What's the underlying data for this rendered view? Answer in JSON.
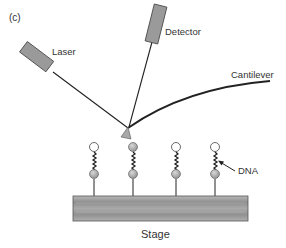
{
  "figure": {
    "panel_label": "(c)"
  },
  "labels": {
    "laser": "Laser",
    "detector": "Detector",
    "cantilever": "Cantilever",
    "dna": "DNA",
    "stage": "Stage"
  },
  "components": {
    "laser": {
      "shape": "rectangle",
      "fill": "#9a9a9a",
      "stroke": "#444444"
    },
    "detector": {
      "shape": "rectangle",
      "fill": "#9a9a9a",
      "stroke": "#444444"
    },
    "cantilever": {
      "shape": "curve",
      "stroke": "#222222"
    },
    "tip": {
      "shape": "triangle",
      "fill": "#a8a8a8"
    },
    "stage": {
      "shape": "rectangle",
      "fill": "#9e9e9e"
    }
  },
  "molecules": [
    {
      "index": 1,
      "top_sphere": "white",
      "bottom_sphere": "gray"
    },
    {
      "index": 2,
      "top_sphere": "gray",
      "bottom_sphere": "gray",
      "contacted_by_tip": true
    },
    {
      "index": 3,
      "top_sphere": "white",
      "bottom_sphere": "gray"
    },
    {
      "index": 4,
      "top_sphere": "white",
      "bottom_sphere": "gray",
      "labeled": "DNA"
    }
  ],
  "colors": {
    "line": "#222222",
    "box_fill": "#9a9a9a",
    "sphere_gray": "#a6a6a6",
    "sphere_white": "#ffffff",
    "text": "#333333"
  }
}
